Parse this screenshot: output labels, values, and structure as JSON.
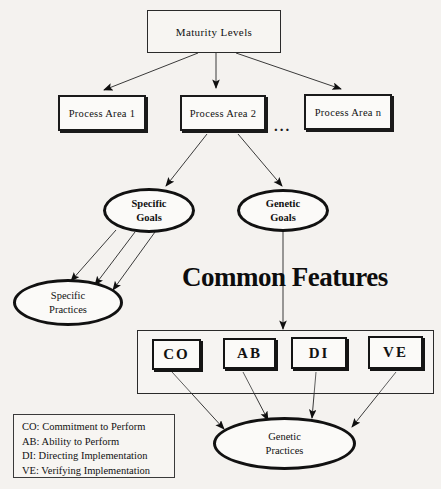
{
  "diagram": {
    "title_text": "Common Features",
    "ellipsis": "...",
    "nodes": {
      "maturity_levels": "Maturity Levels",
      "process_area_1": "Process Area 1",
      "process_area_2": "Process Area 2",
      "process_area_n": "Process Area n",
      "specific_goals_line1": "Specific",
      "specific_goals_line2": "Goals",
      "genetic_goals_line1": "Genetic",
      "genetic_goals_line2": "Goals",
      "specific_practices_line1": "Specific",
      "specific_practices_line2": "Practices",
      "genetic_practices_line1": "Genetic",
      "genetic_practices_line2": "Practices",
      "cf_co": "CO",
      "cf_ab": "AB",
      "cf_di": "DI",
      "cf_ve": "VE"
    },
    "legend": {
      "row1": "CO: Commitment to Perform",
      "row2": "AB: Ability to Perform",
      "row3": "DI: Directing Implementation",
      "row4": "VE: Verifying Implementation"
    },
    "colors": {
      "background": "#f4f2ef",
      "ink": "#111111",
      "node_fill": "#fbfaf8",
      "connector": "#3a3a3a"
    }
  }
}
